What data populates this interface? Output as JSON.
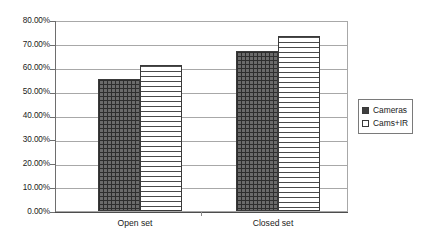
{
  "chart_data": {
    "type": "bar",
    "title": "",
    "xlabel": "",
    "ylabel": "",
    "categories": [
      "Open set",
      "Closed set"
    ],
    "series": [
      {
        "name": "Cameras",
        "values": [
          55.5,
          67.0
        ]
      },
      {
        "name": "Cams+IR",
        "values": [
          61.0,
          73.5
        ]
      }
    ],
    "ylim": [
      0,
      80
    ],
    "ytick_values": [
      0,
      10,
      20,
      30,
      40,
      50,
      60,
      70,
      80
    ],
    "ytick_labels": [
      "0.00%",
      "10.00%",
      "20.00%",
      "30.00%",
      "40.00%",
      "50.00%",
      "60.00%",
      "70.00%",
      "80.00%"
    ],
    "grid": true,
    "legend_position": "right",
    "legend": [
      {
        "label": "Cameras",
        "swatch": "filled-crosshatch",
        "color": "#3f3f3f"
      },
      {
        "label": "Cams+IR",
        "swatch": "empty-horizontal-lines",
        "color": "#ffffff"
      }
    ],
    "value_suffix": "%"
  },
  "axes": {
    "y_ticks": [
      {
        "label": "80.00%",
        "value": 80
      },
      {
        "label": "70.00%",
        "value": 70
      },
      {
        "label": "60.00%",
        "value": 60
      },
      {
        "label": "50.00%",
        "value": 50
      },
      {
        "label": "40.00%",
        "value": 40
      },
      {
        "label": "30.00%",
        "value": 30
      },
      {
        "label": "20.00%",
        "value": 20
      },
      {
        "label": "10.00%",
        "value": 10
      },
      {
        "label": "0.00%",
        "value": 0
      }
    ],
    "x_categories": [
      "Open set",
      "Closed set"
    ]
  },
  "legend": {
    "items": [
      {
        "label": "Cameras"
      },
      {
        "label": "Cams+IR"
      }
    ]
  },
  "colors": {
    "bar_cameras": "#6b6b6b",
    "bar_camsir": "#ffffff",
    "gridline": "#a8a8a8",
    "axis": "#4d4d4d",
    "text": "#1a1a1a"
  }
}
